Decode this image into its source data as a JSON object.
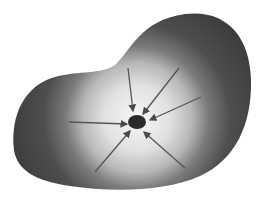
{
  "diagram": {
    "colors": {
      "background": "#ffffff",
      "edge": "#4a4a4a",
      "interior": "#f4f4f4",
      "center_spot": "#2a2a2a",
      "arrow": "#555555"
    },
    "center": {
      "x": 137,
      "y": 122
    },
    "arrows": [
      {
        "from": [
          128,
          68
        ],
        "to": [
          133,
          111
        ]
      },
      {
        "from": [
          179,
          68
        ],
        "to": [
          143,
          114
        ]
      },
      {
        "from": [
          201,
          97
        ],
        "to": [
          150,
          120
        ]
      },
      {
        "from": [
          69,
          122
        ],
        "to": [
          127,
          124
        ]
      },
      {
        "from": [
          95,
          172
        ],
        "to": [
          130,
          131
        ]
      },
      {
        "from": [
          185,
          168
        ],
        "to": [
          144,
          132
        ]
      }
    ]
  }
}
